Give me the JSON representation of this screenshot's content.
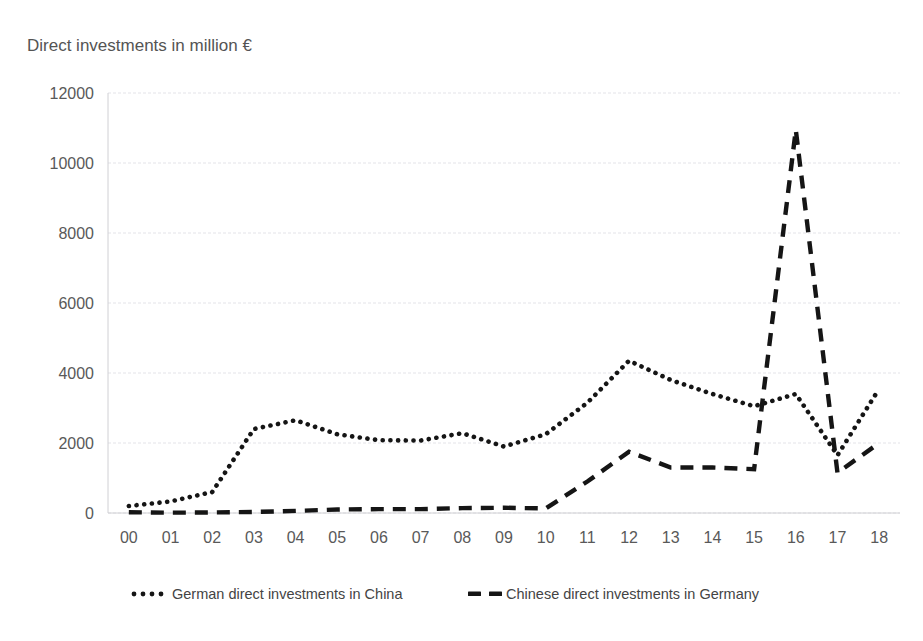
{
  "chart_data": {
    "type": "line",
    "title": "Direct investments in million €",
    "xlabel": "",
    "ylabel": "Direct investments in million €",
    "categories": [
      "00",
      "01",
      "02",
      "03",
      "04",
      "05",
      "06",
      "07",
      "08",
      "09",
      "10",
      "11",
      "12",
      "13",
      "14",
      "15",
      "16",
      "17",
      "18"
    ],
    "yticks": [
      "0",
      "2000",
      "4000",
      "6000",
      "8000",
      "10000",
      "12000"
    ],
    "ylim": [
      0,
      12000
    ],
    "grid": true,
    "legend_position": "bottom",
    "series": [
      {
        "name": "German direct investments in China",
        "style": "dotted",
        "color": "#151515",
        "values": [
          200,
          330,
          600,
          2400,
          2650,
          2250,
          2080,
          2070,
          2280,
          1900,
          2250,
          3150,
          4350,
          3800,
          3400,
          3050,
          3400,
          1650,
          3550
        ]
      },
      {
        "name": "Chinese direct investments in Germany",
        "style": "dashed",
        "color": "#151515",
        "values": [
          20,
          10,
          15,
          30,
          60,
          100,
          110,
          110,
          140,
          150,
          130,
          900,
          1750,
          1300,
          1300,
          1250,
          10950,
          1150,
          2000
        ]
      }
    ]
  },
  "axis_title": "Direct investments in million €",
  "legend": {
    "items": [
      {
        "label": "German direct investments in China",
        "marker": "dotted-line-marker"
      },
      {
        "label": "Chinese direct investments in Germany",
        "marker": "dashed-line-marker"
      }
    ]
  }
}
